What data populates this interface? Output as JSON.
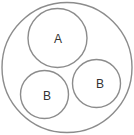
{
  "diagram": {
    "outer": {
      "cx": 67,
      "cy": 67.5,
      "r": 65
    },
    "circles": [
      {
        "label": "A",
        "cx": 57.5,
        "cy": 38,
        "r": 29.5
      },
      {
        "label": "B",
        "cx": 44.5,
        "cy": 94.5,
        "r": 24
      },
      {
        "label": "B",
        "cx": 96.5,
        "cy": 83.5,
        "r": 24
      }
    ],
    "stroke_color": "#8c8c8c"
  }
}
